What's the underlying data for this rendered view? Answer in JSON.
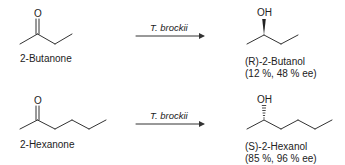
{
  "reactions": [
    {
      "substrate": {
        "name": "2-Butanone",
        "atom_label": "O"
      },
      "reagent": "T. brockii",
      "product": {
        "name": "(R)-2-Butanol",
        "result": "(12 %, 48 % ee)",
        "atom_label": "OH",
        "stereo_bond": "wedge"
      }
    },
    {
      "substrate": {
        "name": "2-Hexanone",
        "atom_label": "O"
      },
      "reagent": "T. brockii",
      "product": {
        "name": "(S)-2-Hexanol",
        "result": "(85 %, 96 % ee)",
        "atom_label": "OH",
        "stereo_bond": "hash"
      }
    }
  ],
  "colors": {
    "ink": "#222222",
    "background": "#ffffff"
  }
}
